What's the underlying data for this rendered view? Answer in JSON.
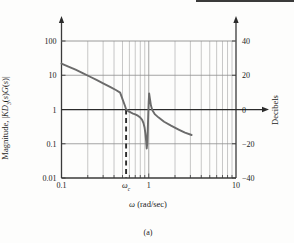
{
  "figure": {
    "caption": "(a)",
    "top_rule": "decorative-rule"
  },
  "chart_data": {
    "type": "line",
    "title": "",
    "subtitle": "",
    "xlabel": "ω (rad/sec)",
    "ylabel": "Magnitude, |KD₃(s)G(s)|",
    "y2label": "Decibels",
    "xscale": "log",
    "yscale": "log",
    "xlim": [
      0.1,
      10
    ],
    "ylim": [
      0.01,
      100
    ],
    "y2lim": [
      -40,
      40
    ],
    "grid": "vertical log minor gridlines plus horizontal decade lines",
    "legend": null,
    "xticks": [
      0.1,
      1,
      10
    ],
    "xticklabels": [
      "0.1",
      "1",
      "10"
    ],
    "xtick_special": {
      "value": 0.55,
      "label": "ωc"
    },
    "yticks": [
      0.01,
      0.1,
      1,
      10,
      100
    ],
    "yticklabels": [
      "0.01",
      "0.1",
      "1",
      "10",
      "100"
    ],
    "y2ticks": [
      -40,
      -20,
      0,
      20,
      40
    ],
    "y2ticklabels": [
      "-40",
      "-20",
      "0",
      "20",
      "40"
    ],
    "annotations": [
      {
        "name": "crossover-dashed-line",
        "type": "vline",
        "x": 0.55,
        "style": "dashed",
        "from_y": 1,
        "to_y": 0.01
      },
      {
        "name": "zero-db-line",
        "type": "hline",
        "y": 1,
        "style": "solid-with-arrow"
      }
    ],
    "series": [
      {
        "name": "|KD3(s)G(s)|",
        "color": "#6b6b6b",
        "points": [
          [
            0.1,
            22.0
          ],
          [
            0.12,
            18.0
          ],
          [
            0.145,
            14.5
          ],
          [
            0.175,
            11.6
          ],
          [
            0.21,
            9.2
          ],
          [
            0.255,
            7.2
          ],
          [
            0.3,
            5.8
          ],
          [
            0.36,
            4.6
          ],
          [
            0.42,
            3.7
          ],
          [
            0.47,
            3.1
          ],
          [
            0.5,
            2.0
          ],
          [
            0.53,
            1.35
          ],
          [
            0.55,
            1.02
          ],
          [
            0.58,
            0.9
          ],
          [
            0.62,
            0.82
          ],
          [
            0.66,
            0.76
          ],
          [
            0.7,
            0.72
          ],
          [
            0.75,
            0.66
          ],
          [
            0.8,
            0.58
          ],
          [
            0.84,
            0.5
          ],
          [
            0.87,
            0.4
          ],
          [
            0.895,
            0.3
          ],
          [
            0.915,
            0.2
          ],
          [
            0.935,
            0.115
          ],
          [
            0.948,
            0.073
          ],
          [
            0.96,
            0.1
          ],
          [
            0.972,
            0.22
          ],
          [
            0.985,
            0.6
          ],
          [
            0.998,
            1.6
          ],
          [
            1.01,
            2.95
          ],
          [
            1.03,
            2.1
          ],
          [
            1.06,
            1.3
          ],
          [
            1.1,
            0.95
          ],
          [
            1.18,
            0.72
          ],
          [
            1.3,
            0.58
          ],
          [
            1.5,
            0.44
          ],
          [
            1.8,
            0.34
          ],
          [
            2.2,
            0.26
          ],
          [
            2.6,
            0.21
          ],
          [
            3.1,
            0.18
          ]
        ]
      }
    ]
  }
}
